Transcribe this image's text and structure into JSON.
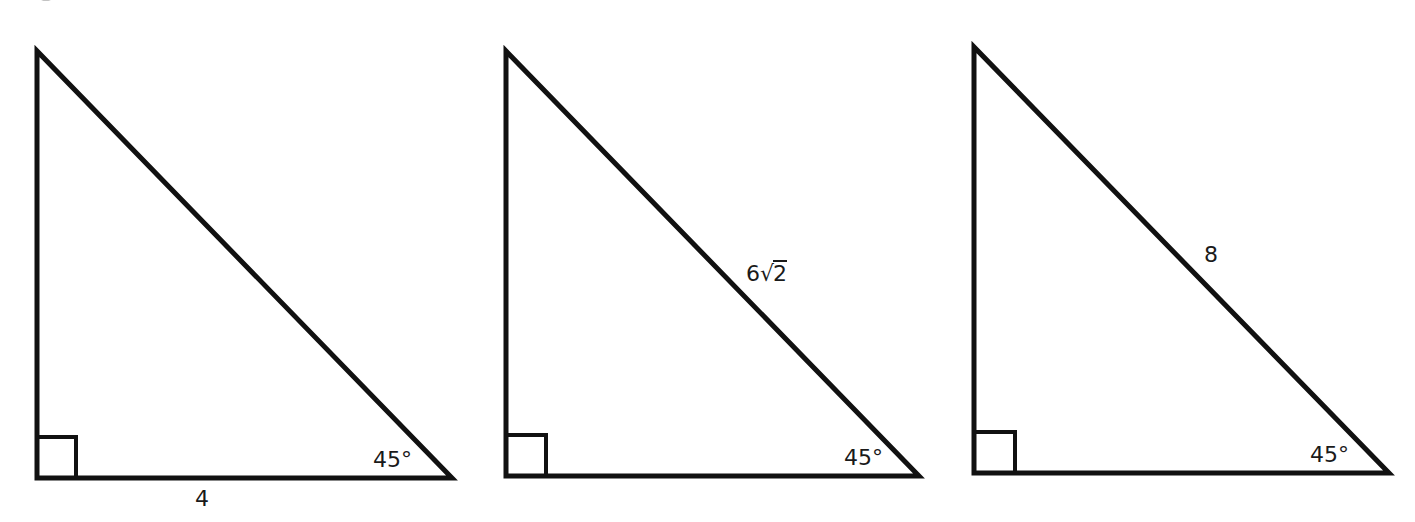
{
  "diagram": {
    "stroke_color": "#111111",
    "triangles": [
      {
        "id": "triangle-1",
        "angle_label": "45°",
        "side_label": "4",
        "side": "bottom leg",
        "right_angle_marker": true
      },
      {
        "id": "triangle-2",
        "angle_label": "45°",
        "side_label_coef": "6",
        "side_label_radical": "2",
        "side_label_full": "6√2",
        "side": "hypotenuse",
        "right_angle_marker": true
      },
      {
        "id": "triangle-3",
        "angle_label": "45°",
        "side_label": "8",
        "side": "hypotenuse",
        "right_angle_marker": true
      }
    ]
  }
}
